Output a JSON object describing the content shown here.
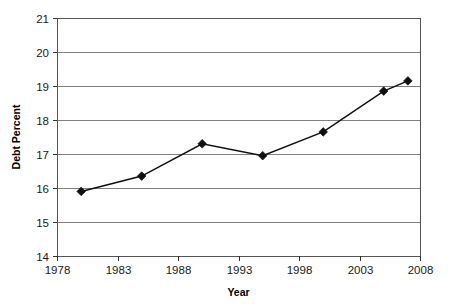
{
  "chart_data": {
    "type": "line",
    "title": "",
    "xlabel": "Year",
    "ylabel": "Debt Percent",
    "xlim": [
      1978,
      2008
    ],
    "ylim": [
      14,
      21
    ],
    "x_ticks": [
      1978,
      1983,
      1988,
      1993,
      1998,
      2003,
      2008
    ],
    "y_ticks": [
      14,
      15,
      16,
      17,
      18,
      19,
      20,
      21
    ],
    "grid": "horizontal",
    "legend": "none",
    "marker_style": "filled-diamond",
    "line_color": "#101010",
    "grid_color": "#808080",
    "x": [
      1980,
      1985,
      1990,
      1995,
      2000,
      2005,
      2007
    ],
    "values": [
      15.9,
      16.35,
      17.3,
      16.95,
      17.65,
      18.85,
      19.15
    ],
    "series": [
      {
        "name": "Debt Percent",
        "points": [
          {
            "x": 1980,
            "y": 15.9
          },
          {
            "x": 1985,
            "y": 16.35
          },
          {
            "x": 1990,
            "y": 17.3
          },
          {
            "x": 1995,
            "y": 16.95
          },
          {
            "x": 2000,
            "y": 17.65
          },
          {
            "x": 2005,
            "y": 18.85
          },
          {
            "x": 2007,
            "y": 19.15
          }
        ]
      }
    ]
  }
}
